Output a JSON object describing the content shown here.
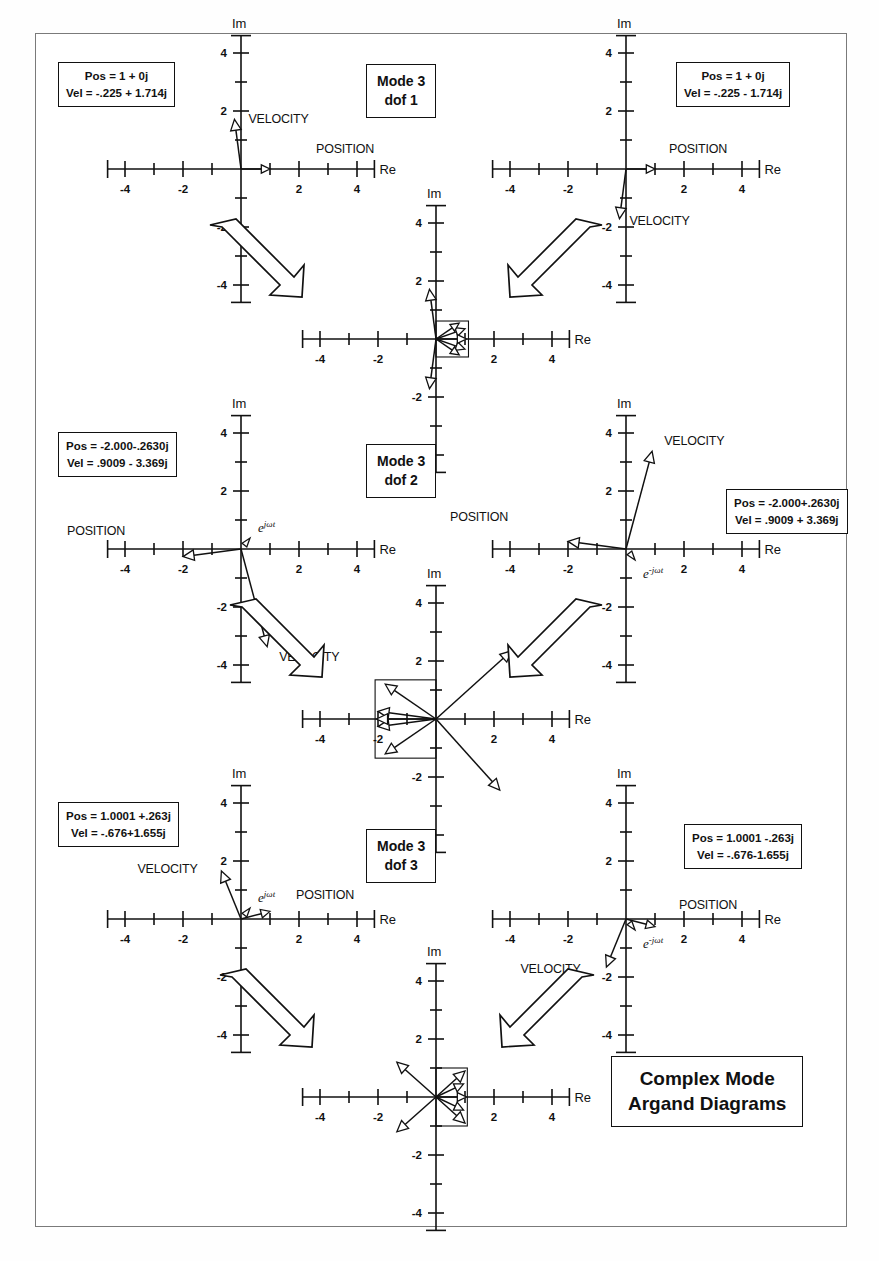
{
  "document": {
    "title_box": {
      "line1": "Complex Mode",
      "line2": "Argand Diagrams"
    }
  },
  "axes": {
    "re_label": "Re",
    "im_label": "Im",
    "x_ticks": [
      "-4",
      "-2",
      "2",
      "4"
    ],
    "y_ticks": [
      "4",
      "2",
      "-2",
      "-4"
    ],
    "xlim": [
      -4.6,
      4.6
    ],
    "ylim": [
      -4.6,
      4.6
    ],
    "tick_step": 1
  },
  "labels": {
    "position": "POSITION",
    "velocity": "VELOCITY",
    "rot_pos": "e",
    "rot_pos_sup": "jωt",
    "rot_neg": "e",
    "rot_neg_sup": "-jωt"
  },
  "rows": [
    {
      "mode_box": {
        "line1": "Mode 3",
        "line2": "dof 1"
      },
      "left": {
        "info": {
          "pos": "Pos = 1 + 0j",
          "vel": "Vel = -.225 + 1.714j"
        },
        "position": {
          "re": 1.0,
          "im": 0.0
        },
        "velocity": {
          "re": -0.225,
          "im": 1.714
        },
        "pos_label_dx": 46,
        "pos_label_dy": -16,
        "vel_label_dx": 14,
        "vel_label_dy": 4,
        "show_rot": false
      },
      "right": {
        "info": {
          "pos": "Pos = 1 + 0j",
          "vel": "Vel = -.225 - 1.714j"
        },
        "position": {
          "re": 1.0,
          "im": 0.0
        },
        "velocity": {
          "re": -0.225,
          "im": -1.714
        },
        "pos_label_dx": 14,
        "pos_label_dy": -16,
        "vel_label_dx": 10,
        "vel_label_dy": 6,
        "show_rot": false
      },
      "middle": {
        "vectors": [
          {
            "re": -0.225,
            "im": 1.714
          },
          {
            "re": -0.225,
            "im": -1.714
          },
          {
            "re": 1.0,
            "im": 0.35
          },
          {
            "re": 1.0,
            "im": -0.35
          },
          {
            "re": 0.8,
            "im": 0.55
          },
          {
            "re": 0.8,
            "im": -0.55
          },
          {
            "re": 1.05,
            "im": 0.0
          }
        ],
        "bbox": {
          "x0": 0.0,
          "y0": -0.62,
          "x1": 1.12,
          "y1": 0.62
        }
      }
    },
    {
      "mode_box": {
        "line1": "Mode 3",
        "line2": "dof 2"
      },
      "left": {
        "info": {
          "pos": "Pos = -2.000-.2630j",
          "vel": "Vel = .9009 - 3.369j"
        },
        "position": {
          "re": -2.0,
          "im": -0.263
        },
        "velocity": {
          "re": 0.9009,
          "im": -3.369
        },
        "pos_label_dx": -116,
        "pos_label_dy": -22,
        "vel_label_dx": 12,
        "vel_label_dy": 14,
        "show_rot": true,
        "rot_sign": "pos"
      },
      "right": {
        "info": {
          "pos": "Pos = -2.000+.2630j",
          "vel": "Vel = .9009 + 3.369j"
        },
        "position": {
          "re": -2.0,
          "im": 0.263
        },
        "velocity": {
          "re": 0.9009,
          "im": 3.369
        },
        "pos_label_dx": -118,
        "pos_label_dy": -20,
        "vel_label_dx": 12,
        "vel_label_dy": -6,
        "show_rot": true,
        "rot_sign": "neg"
      },
      "middle": {
        "vectors": [
          {
            "re": -2.0,
            "im": -0.263
          },
          {
            "re": -2.0,
            "im": 0.263
          },
          {
            "re": -1.75,
            "im": 1.2
          },
          {
            "re": -1.75,
            "im": -1.2
          },
          {
            "re": 2.6,
            "im": 2.35
          },
          {
            "re": 2.2,
            "im": -2.45
          },
          {
            "re": -2.05,
            "im": 0.0
          }
        ],
        "bbox": {
          "x0": -2.1,
          "y0": -1.35,
          "x1": 0.0,
          "y1": 1.35
        }
      }
    },
    {
      "mode_box": {
        "line1": "Mode 3",
        "line2": "dof 3"
      },
      "left": {
        "info": {
          "pos": "Pos = 1.0001 +.263j",
          "vel": "Vel = -.676+1.655j"
        },
        "position": {
          "re": 1.0001,
          "im": 0.263
        },
        "velocity": {
          "re": -0.676,
          "im": 1.655
        },
        "pos_label_dx": 26,
        "pos_label_dy": -12,
        "vel_label_dx": -84,
        "vel_label_dy": 2,
        "show_rot": true,
        "rot_sign": "pos"
      },
      "right": {
        "info": {
          "pos": "Pos = 1.0001 -.263j",
          "vel": "Vel = -.676-1.655j"
        },
        "position": {
          "re": 1.0001,
          "im": -0.263
        },
        "velocity": {
          "re": -0.676,
          "im": -1.655
        },
        "pos_label_dx": 24,
        "pos_label_dy": -18,
        "vel_label_dx": -86,
        "vel_label_dy": 6,
        "show_rot": true,
        "rot_sign": "neg"
      },
      "middle": {
        "vectors": [
          {
            "re": -1.35,
            "im": 1.2
          },
          {
            "re": -1.35,
            "im": -1.2
          },
          {
            "re": 1.0,
            "im": 0.9
          },
          {
            "re": 1.0,
            "im": -0.9
          },
          {
            "re": 0.95,
            "im": 0.45
          },
          {
            "re": 0.95,
            "im": -0.45
          },
          {
            "re": 1.05,
            "im": 0.0
          }
        ],
        "bbox": {
          "x0": 0.0,
          "y0": -1.0,
          "x1": 1.08,
          "y1": 1.0
        }
      }
    }
  ]
}
